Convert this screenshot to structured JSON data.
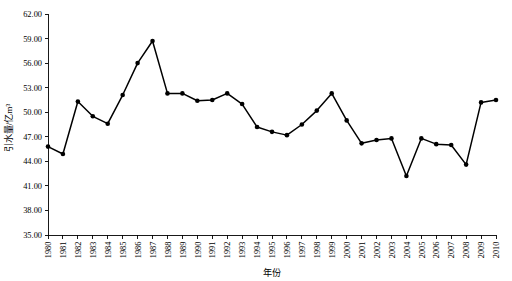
{
  "chart_data": {
    "type": "line",
    "title": "",
    "xlabel": "年份",
    "ylabel": "引水量/亿m³",
    "xlim": [
      1980,
      2010
    ],
    "ylim": [
      35.0,
      62.0
    ],
    "yticks": [
      "35.00",
      "38.00",
      "41.00",
      "44.00",
      "47.00",
      "50.00",
      "53.00",
      "56.00",
      "59.00",
      "62.00"
    ],
    "ytick_values": [
      35.0,
      38.0,
      41.0,
      44.0,
      47.0,
      50.0,
      53.0,
      56.0,
      59.0,
      62.0
    ],
    "grid": false,
    "legend": null,
    "marker": "filled-circle",
    "line_color": "#000000",
    "marker_color": "#000000",
    "categories": [
      "1980",
      "1981",
      "1982",
      "1983",
      "1984",
      "1985",
      "1986",
      "1987",
      "1988",
      "1989",
      "1990",
      "1991",
      "1992",
      "1993",
      "1994",
      "1995",
      "1996",
      "1997",
      "1998",
      "1999",
      "2000",
      "2001",
      "2002",
      "2003",
      "2004",
      "2005",
      "2006",
      "2007",
      "2008",
      "2009",
      "2010"
    ],
    "x": [
      1980,
      1981,
      1982,
      1983,
      1984,
      1985,
      1986,
      1987,
      1988,
      1989,
      1990,
      1991,
      1992,
      1993,
      1994,
      1995,
      1996,
      1997,
      1998,
      1999,
      2000,
      2001,
      2002,
      2003,
      2004,
      2005,
      2006,
      2007,
      2008,
      2009,
      2010
    ],
    "values": [
      45.8,
      44.9,
      51.3,
      49.5,
      48.6,
      52.1,
      56.0,
      58.7,
      52.3,
      52.3,
      51.4,
      51.5,
      52.3,
      51.0,
      48.2,
      47.6,
      47.2,
      48.5,
      50.2,
      52.3,
      49.0,
      46.2,
      46.6,
      46.8,
      42.2,
      46.8,
      46.1,
      46.0,
      43.6,
      51.2,
      51.5
    ],
    "series": [
      {
        "name": "引水量",
        "values": [
          45.8,
          44.9,
          51.3,
          49.5,
          48.6,
          52.1,
          56.0,
          58.7,
          52.3,
          52.3,
          51.4,
          51.5,
          52.3,
          51.0,
          48.2,
          47.6,
          47.2,
          48.5,
          50.2,
          52.3,
          49.0,
          46.2,
          46.6,
          46.8,
          42.2,
          46.8,
          46.1,
          46.0,
          43.6,
          51.2,
          51.5
        ]
      }
    ]
  }
}
